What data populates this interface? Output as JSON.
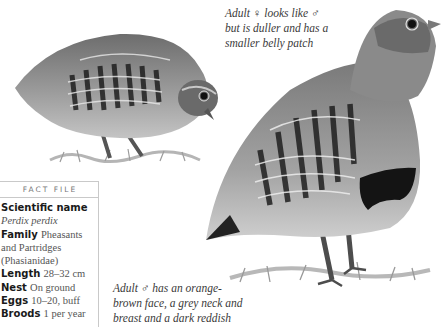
{
  "female_caption": {
    "lines": [
      "Adult ♀ looks like ♂",
      "but is duller and has a",
      "smaller belly patch"
    ]
  },
  "male_caption": {
    "lines": [
      "Adult ♂ has an orange-",
      "brown face, a grey neck and",
      "breast and a dark reddish"
    ]
  },
  "fact_file": {
    "title": "FACT FILE",
    "scientific_name_label": "Scientific name",
    "scientific_name_value": "Perdix perdix",
    "family_label": "Family",
    "family_value": "Pheasants and Partridges (Phasianidae)",
    "length_label": "Length",
    "length_value": "28–32 cm",
    "nest_label": "Nest",
    "nest_value": "On ground",
    "eggs_label": "Eggs",
    "eggs_value": "10–20, buff",
    "broods_label": "Broods",
    "broods_value": "1 per year"
  },
  "illustrations": {
    "left_bird": "grey-partridge-female-feeding",
    "right_bird": "grey-partridge-male-standing"
  },
  "colors": {
    "background": "#ffffff",
    "divider": "#c9c9c9",
    "bird_body": "#9a9a9a",
    "bird_dark": "#222222"
  }
}
